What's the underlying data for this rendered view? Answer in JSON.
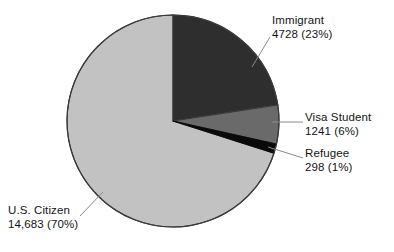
{
  "chart_data": {
    "type": "pie",
    "title": "",
    "subtitle": "",
    "xlabel": "",
    "ylabel": "",
    "legend_position": "none",
    "grid": false,
    "total": 20950,
    "start_angle_deg": 0,
    "direction": "clockwise",
    "categories": [
      "Immigrant",
      "Visa Student",
      "Refugee",
      "U.S. Citizen"
    ],
    "values": [
      4728,
      1241,
      298,
      14683
    ],
    "percents": [
      23,
      6,
      1,
      70
    ],
    "colors": [
      "#2e2e2e",
      "#6a6a6a",
      "#0a0a0a",
      "#c2c2c2"
    ],
    "slices": [
      {
        "name": "Immigrant",
        "value": 4728,
        "value_text": "4728",
        "percent": 23,
        "percent_text": "(23%)",
        "label_line1": "Immigrant",
        "label_line2": "4728 (23%)",
        "color": "#2e2e2e"
      },
      {
        "name": "Visa Student",
        "value": 1241,
        "value_text": "1241",
        "percent": 6,
        "percent_text": "(6%)",
        "label_line1": "Visa Student",
        "label_line2": "1241 (6%)",
        "color": "#6a6a6a"
      },
      {
        "name": "Refugee",
        "value": 298,
        "value_text": "298",
        "percent": 1,
        "percent_text": "(1%)",
        "label_line1": "Refugee",
        "label_line2": "298 (1%)",
        "color": "#0a0a0a"
      },
      {
        "name": "U.S. Citizen",
        "value": 14683,
        "value_text": "14,683",
        "percent": 70,
        "percent_text": "(70%)",
        "label_line1": "U.S. Citizen",
        "label_line2": "14,683 (70%)",
        "color": "#c2c2c2"
      }
    ]
  },
  "geometry": {
    "center_x": 173,
    "center_y": 121,
    "radius": 106,
    "outline_color": "#3a3a3a",
    "background": "#ffffff",
    "leader_color": "#8a8a8a"
  }
}
